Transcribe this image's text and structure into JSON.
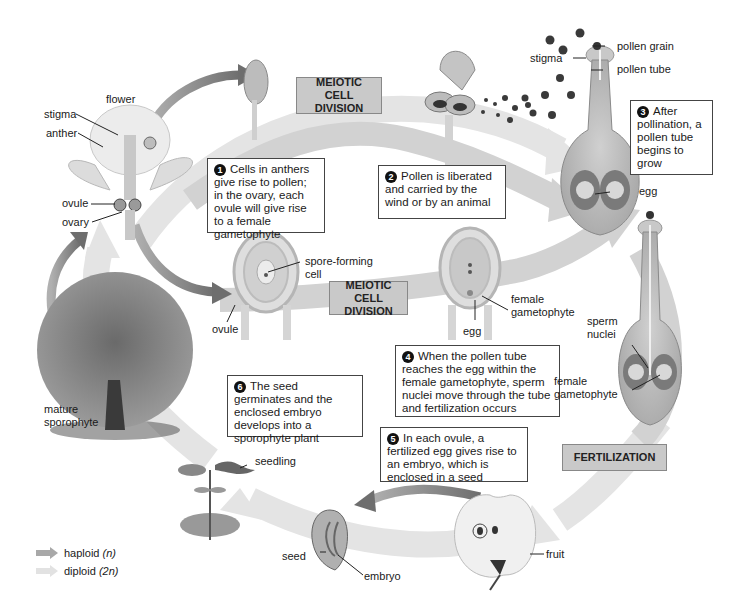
{
  "diagram": {
    "type": "angiosperm-life-cycle",
    "colors": {
      "haploid_arrow": "#a8a8a8",
      "diploid_arrow": "#e2e2e2",
      "stage_box": "#c9c9c9",
      "transition_arrow": "#7a7a7a"
    },
    "stage_boxes": {
      "meiotic_top": "MEIOTIC CELL DIVISION",
      "meiotic_middle": "MEIOTIC CELL DIVISION",
      "fertilization": "FERTILIZATION"
    },
    "steps": [
      {
        "num": "1",
        "text": "Cells in anthers give rise to pollen; in the ovary, each ovule will give rise to a female gametophyte"
      },
      {
        "num": "2",
        "text": "Pollen is liberated and carried by the wind or by an animal"
      },
      {
        "num": "3",
        "text": "After pollination, a pollen tube begins to grow"
      },
      {
        "num": "4",
        "text": "When the pollen tube reaches the egg within the female gametophyte, sperm nuclei move through the tube and fertilization occurs"
      },
      {
        "num": "5",
        "text": "In each ovule, a fertilized egg gives rise to an embryo, which is enclosed in a seed"
      },
      {
        "num": "6",
        "text": "The seed germinates and the enclosed embryo develops into a sporophyte plant"
      }
    ],
    "labels": {
      "flower": "flower",
      "stigma_flower": "stigma",
      "anther": "anther",
      "ovule_flower": "ovule",
      "ovary": "ovary",
      "spore_forming_cell": "spore-forming\ncell",
      "ovule_middle": "ovule",
      "egg_middle": "egg",
      "female_gametophyte_middle": "female\ngametophyte",
      "pollen_grain": "pollen grain",
      "stigma_pistil": "stigma",
      "pollen_tube": "pollen tube",
      "egg_pistil": "egg",
      "sperm_nuclei": "sperm\nnuclei",
      "female_gametophyte_right": "female\ngametophyte",
      "mature_sporophyte": "mature\nsporophyte",
      "seedling": "seedling",
      "seed": "seed",
      "embryo": "embryo",
      "fruit": "fruit"
    },
    "legend": [
      {
        "label": "haploid",
        "notation": "(n)",
        "color": "#a8a8a8"
      },
      {
        "label": "diploid",
        "notation": "(2n)",
        "color": "#e2e2e2"
      }
    ]
  }
}
